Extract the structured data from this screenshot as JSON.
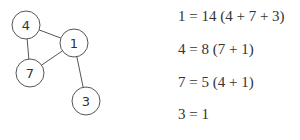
{
  "graph": {
    "nodes": [
      {
        "id": "4",
        "label": "4",
        "x": 26,
        "y": 25
      },
      {
        "id": "1",
        "label": "1",
        "x": 74,
        "y": 43
      },
      {
        "id": "7",
        "label": "7",
        "x": 30,
        "y": 73
      },
      {
        "id": "3",
        "label": "3",
        "x": 86,
        "y": 101
      }
    ],
    "edges": [
      [
        "4",
        "1"
      ],
      [
        "4",
        "7"
      ],
      [
        "7",
        "1"
      ],
      [
        "1",
        "3"
      ]
    ]
  },
  "equations": [
    "1 = 14 (4 + 7 + 3)",
    "4 = 8 (7 + 1)",
    "7 = 5 (4 + 1)",
    "3 = 1"
  ]
}
